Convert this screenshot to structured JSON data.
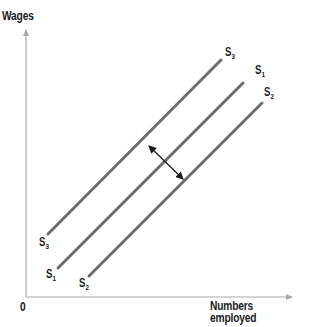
{
  "diagram": {
    "type": "labour-supply-shift",
    "axes": {
      "y_label": "Wages",
      "x_label": "Numbers employed",
      "origin_label": "0"
    },
    "curves": [
      {
        "id": "S3",
        "letter": "S",
        "sub": "3",
        "role": "decreased supply (shift left)"
      },
      {
        "id": "S1",
        "letter": "S",
        "sub": "1",
        "role": "original supply"
      },
      {
        "id": "S2",
        "letter": "S",
        "sub": "2",
        "role": "increased supply (shift right)"
      }
    ],
    "annotation": "double-headed arrow between S3 and S2 indicating shifts of supply curve",
    "colors": {
      "curve": "#6e6e6e",
      "axis": "#a8a8a8",
      "text": "#1a1a1a"
    }
  }
}
